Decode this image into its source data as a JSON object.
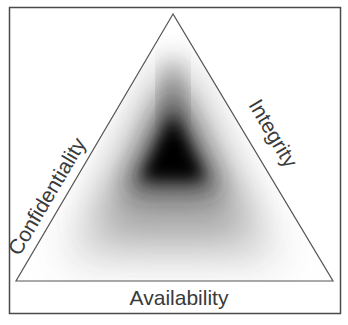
{
  "diagram": {
    "labels": {
      "left": "Confidentiality",
      "right": "Integrity",
      "bottom": "Availability"
    },
    "colors": {
      "frame": "#4a4a4a",
      "triangle_stroke": "#555555",
      "core": "#000000",
      "background": "#ffffff",
      "text": "#3a3a3a"
    }
  }
}
